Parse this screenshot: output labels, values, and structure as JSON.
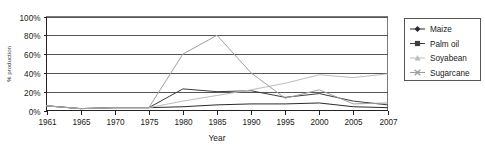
{
  "chart_data": {
    "type": "line",
    "title": "",
    "xlabel": "Year",
    "ylabel": "% production",
    "x": [
      1961,
      1965,
      1970,
      1975,
      1980,
      1985,
      1990,
      1995,
      2000,
      2005,
      2007
    ],
    "xtick_labels": [
      "1961",
      "1965",
      "1970",
      "1975",
      "1980",
      "1985",
      "1990",
      "1995",
      "2000",
      "2005",
      "2007"
    ],
    "ytick_labels": [
      "0%",
      "20%",
      "40%",
      "60%",
      "80%",
      "100%"
    ],
    "ytick_values": [
      0,
      20,
      40,
      60,
      80,
      100
    ],
    "ylim": [
      0,
      100
    ],
    "grid": true,
    "legend_position": "right",
    "series": [
      {
        "name": "Maize",
        "marker": "diamond",
        "color": "#2b2b2b",
        "values": [
          5,
          2,
          3,
          3,
          4,
          6,
          7,
          7,
          8,
          4,
          3
        ]
      },
      {
        "name": "Palm oil",
        "marker": "square",
        "color": "#3d3d3d",
        "values": [
          5,
          2,
          3,
          3,
          23,
          20,
          21,
          14,
          18,
          10,
          6
        ]
      },
      {
        "name": "Soyabean",
        "marker": "triangle",
        "color": "#bcbcbc",
        "values": [
          5,
          2,
          3,
          3,
          10,
          16,
          22,
          29,
          38,
          35,
          39
        ]
      },
      {
        "name": "Sugarcane",
        "marker": "cross",
        "color": "#9f9f9f",
        "values": [
          5,
          2,
          3,
          3,
          60,
          80,
          40,
          13,
          22,
          7,
          8
        ]
      }
    ]
  },
  "legend": {
    "entries": [
      {
        "label": "Maize"
      },
      {
        "label": "Palm oil"
      },
      {
        "label": "Soyabean"
      },
      {
        "label": "Sugarcane"
      }
    ]
  }
}
